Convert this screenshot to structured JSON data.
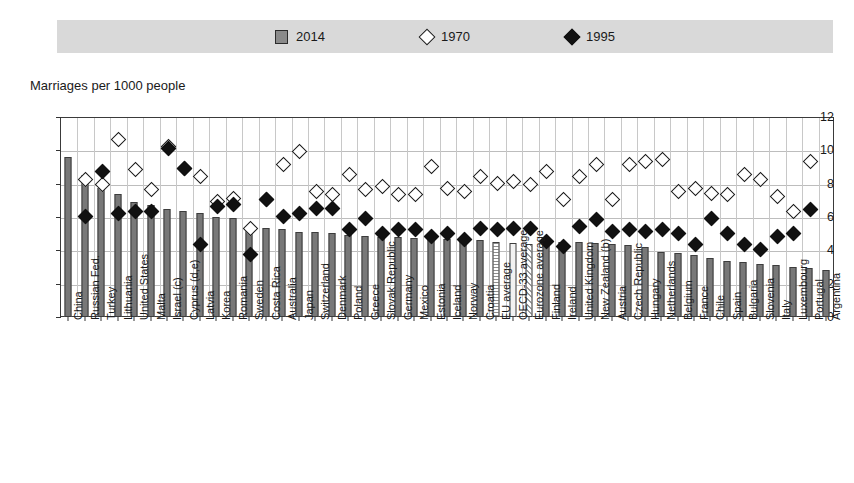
{
  "legend": {
    "items": [
      {
        "label": "2014",
        "marker": "bar-swatch"
      },
      {
        "label": "1970",
        "marker": "open-diamond"
      },
      {
        "label": "1995",
        "marker": "filled-diamond"
      }
    ]
  },
  "axis": {
    "y_title": "Marriages per 1000 people",
    "y_ticks": [
      "12",
      "10",
      "8",
      "6",
      "4",
      "2",
      "0"
    ]
  },
  "colors": {
    "bar_fill": "#787878",
    "bar_stroke": "#3d3d3d",
    "legend_band": "#d9d9d9",
    "grid": "#bdbdbd",
    "diamond_filled": "#111111"
  },
  "chart_data": {
    "type": "bar",
    "title": "Marriages per 1000 people",
    "xlabel": "",
    "ylabel": "Marriages per 1000 people",
    "ylim": [
      0,
      12
    ],
    "yticks": [
      0,
      2,
      4,
      6,
      8,
      10,
      12
    ],
    "grid": true,
    "legend_position": "top",
    "categories": [
      "China",
      "Russian Fed.",
      "Turkey",
      "Lithuania",
      "United States",
      "Malta",
      "Israel (c)",
      "Cyprus (d,e)",
      "Latvia",
      "Korea",
      "Romania",
      "Sweden",
      "Costa Rica",
      "Australia",
      "Japan",
      "Switzerland",
      "Denmark",
      "Poland",
      "Greece",
      "Slovak Republic",
      "Germany",
      "Mexico",
      "Estonia",
      "Iceland",
      "Norway",
      "Croatia",
      "EU average",
      "OECD-33 average",
      "Eurozone average",
      "Finland",
      "Ireland",
      "United Kingdom",
      "New Zealand (b)",
      "Austria",
      "Czech Republic",
      "Hungary",
      "Netherlands",
      "Belgium",
      "France",
      "Chile",
      "Spain",
      "Bulgaria",
      "Slovenia",
      "Italy",
      "Luxembourg",
      "Portugal",
      "Argentina"
    ],
    "series": [
      {
        "name": "2014",
        "marker": "bar",
        "values": [
          9.6,
          8.5,
          7.75,
          7.4,
          6.9,
          6.7,
          6.5,
          6.35,
          6.25,
          6.0,
          5.95,
          5.2,
          5.35,
          5.3,
          5.1,
          5.1,
          5.05,
          4.9,
          4.85,
          4.8,
          4.8,
          4.75,
          4.7,
          4.7,
          4.65,
          4.6,
          4.5,
          4.45,
          4.4,
          4.55,
          4.5,
          4.5,
          4.45,
          4.4,
          4.35,
          4.2,
          3.9,
          3.85,
          3.7,
          3.55,
          3.35,
          3.3,
          3.2,
          3.1,
          3.0,
          2.95,
          2.85
        ]
      },
      {
        "name": "1970",
        "marker": "open-diamond",
        "values": [
          null,
          8.3,
          8.0,
          10.7,
          8.9,
          7.7,
          10.3,
          9.0,
          8.5,
          7.0,
          7.2,
          5.4,
          7.1,
          9.2,
          10.0,
          7.6,
          7.4,
          8.6,
          7.7,
          7.9,
          7.4,
          7.4,
          9.1,
          7.8,
          7.6,
          8.5,
          8.1,
          8.2,
          8.0,
          8.8,
          7.1,
          8.5,
          9.2,
          7.1,
          9.2,
          9.4,
          9.5,
          7.6,
          7.8,
          7.5,
          7.4,
          8.6,
          8.3,
          7.3,
          6.4,
          9.4,
          null
        ]
      },
      {
        "name": "1995",
        "marker": "filled-diamond",
        "values": [
          null,
          6.1,
          8.8,
          6.3,
          6.4,
          6.4,
          10.2,
          9.0,
          4.4,
          6.7,
          6.8,
          3.8,
          7.1,
          6.1,
          6.3,
          6.6,
          6.6,
          5.3,
          6.0,
          5.1,
          5.3,
          5.3,
          4.9,
          5.1,
          4.7,
          5.4,
          5.3,
          5.4,
          5.4,
          4.6,
          4.3,
          5.5,
          5.9,
          5.2,
          5.3,
          5.2,
          5.3,
          5.1,
          4.4,
          6.0,
          5.1,
          4.4,
          4.1,
          4.9,
          5.1,
          6.5,
          null
        ]
      }
    ]
  }
}
